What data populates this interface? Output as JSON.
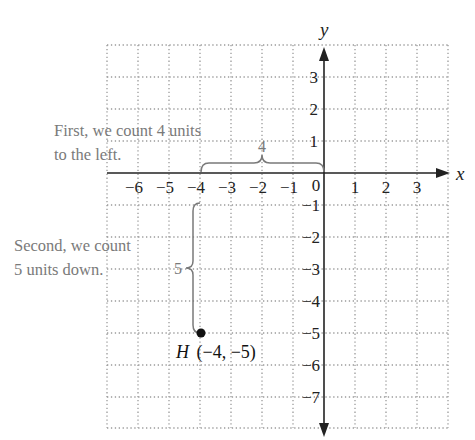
{
  "diagram": {
    "type": "coordinate-plane",
    "axes": {
      "x_label": "x",
      "y_label": "y",
      "origin_label": "0",
      "x_ticks": [
        "−6",
        "−5",
        "−4",
        "−3",
        "−2",
        "−1",
        "1",
        "2",
        "3"
      ],
      "x_tick_values": [
        -6,
        -5,
        -4,
        -3,
        -2,
        -1,
        1,
        2,
        3
      ],
      "y_ticks_positive": [
        "3",
        "2",
        "1"
      ],
      "y_tick_positive_values": [
        3,
        2,
        1
      ],
      "y_ticks_negative": [
        "−1",
        "−2",
        "−3",
        "−4",
        "−5",
        "−6",
        "−7"
      ],
      "y_tick_negative_values": [
        -1,
        -2,
        -3,
        -4,
        -5,
        -6,
        -7
      ],
      "grid_x_range": [
        -7,
        4
      ],
      "grid_y_range": [
        -8,
        4
      ],
      "grid_style": "dotted"
    },
    "annotations": {
      "first_line1": "First, we count 4 units",
      "first_line2": "to the left.",
      "second_line1": "Second, we count",
      "second_line2": "5 units down.",
      "horizontal_brace_label": "4",
      "vertical_brace_label": "5"
    },
    "point": {
      "name": "H",
      "coords_label": "(−4, −5)",
      "x": -4,
      "y": -5
    },
    "colors": {
      "axis": "#222222",
      "grid": "#9a9a9a",
      "annotation": "#7a7a7a",
      "point": "#111111"
    }
  }
}
